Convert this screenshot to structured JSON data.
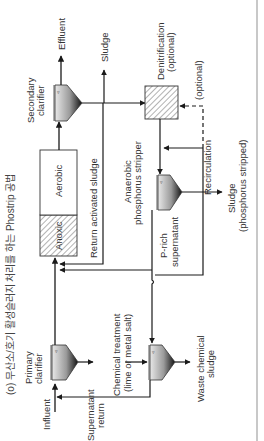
{
  "caption": "(o) 무산소/호기 활성슬러지 처리를 하는 Phostrip 공법",
  "labels": {
    "effluent": "Effluent",
    "sludge_top": "Sludge",
    "secondary_clarifier_1": "Secondary",
    "secondary_clarifier_2": "clarifier",
    "denitrification_1": "Denitrification",
    "denitrification_2": "(optional)",
    "optional_line": "(optional)",
    "aerobic": "Aerobic",
    "anoxic": "Anoxic",
    "return_activated_sludge": "Return activated sludge",
    "stripper_1": "Anaerobic",
    "stripper_2": "phosphorus stripper",
    "recirculation": "Recirculation",
    "sludge_stripped_1": "Sludge",
    "sludge_stripped_2": "(phosphorus stripped)",
    "p_rich_1": "P-rich",
    "p_rich_2": "supernatant",
    "primary_clarifier_1": "Primary",
    "primary_clarifier_2": "clarifier",
    "influent": "Influent",
    "chemical_treatment_1": "Chemical treatment",
    "chemical_treatment_2": "(lime or metal salt)",
    "supernatant_return_1": "Supernatant",
    "supernatant_return_2": "return",
    "waste_chemical_1": "Waste chemical",
    "waste_chemical_2": "sludge"
  },
  "colors": {
    "line": "#1a1a1a",
    "hatch": "#555555",
    "border": "#c8c8c8"
  }
}
